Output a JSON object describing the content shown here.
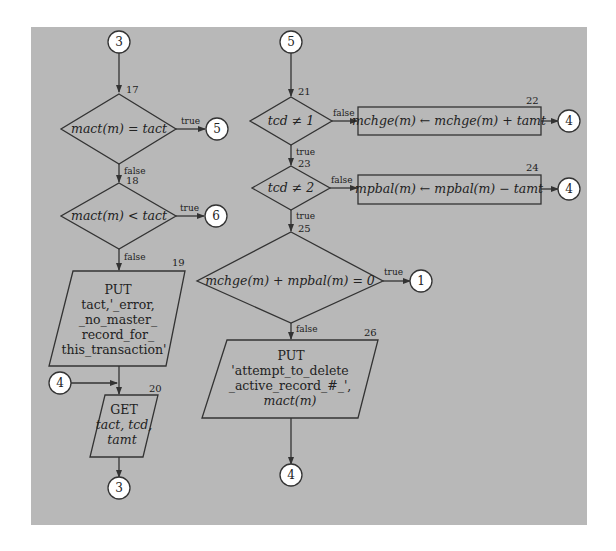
{
  "diagram": {
    "type": "flowchart",
    "colors": {
      "panel_background": "#b8b8b8",
      "page_background": "#ffffff",
      "stroke": "#333333",
      "connector_fill": "#ffffff",
      "text": "#222222"
    },
    "connectors": {
      "c3_top": "3",
      "c5_from17": "5",
      "c6_from18": "6",
      "c4_left": "4",
      "c3_bottom": "3",
      "c5_top": "5",
      "c4_from22": "4",
      "c4_from24": "4",
      "c1_from25": "1",
      "c4_bottom": "4"
    },
    "steps": {
      "s17": {
        "number": "17",
        "type": "decision",
        "text": "mact(m) = tact",
        "true_label": "true",
        "false_label": "false"
      },
      "s18": {
        "number": "18",
        "type": "decision",
        "text": "mact(m) < tact",
        "true_label": "true",
        "false_label": "false"
      },
      "s19": {
        "number": "19",
        "type": "io",
        "lines": [
          "PUT",
          "tact,'_error,",
          "_no_master_",
          "record_for_",
          "this_transaction'"
        ]
      },
      "s20": {
        "number": "20",
        "type": "io",
        "lines": [
          "GET",
          "tact, tcd,",
          "tamt"
        ]
      },
      "s21": {
        "number": "21",
        "type": "decision",
        "text": "tcd ≠ 1",
        "true_label": "true",
        "false_label": "false"
      },
      "s22": {
        "number": "22",
        "type": "process",
        "text": "mchge(m) ← mchge(m) + tamt"
      },
      "s23": {
        "number": "23",
        "type": "decision",
        "text": "tcd ≠ 2",
        "true_label": "true",
        "false_label": "false"
      },
      "s24": {
        "number": "24",
        "type": "process",
        "text": "mpbal(m) ← mpbal(m) − tamt"
      },
      "s25": {
        "number": "25",
        "type": "decision",
        "text": "mchge(m) + mpbal(m) = 0",
        "true_label": "true",
        "false_label": "false"
      },
      "s26": {
        "number": "26",
        "type": "io",
        "lines": [
          "PUT",
          "'attempt_to_delete",
          "_active_record_#_',",
          "mact(m)"
        ]
      }
    }
  }
}
